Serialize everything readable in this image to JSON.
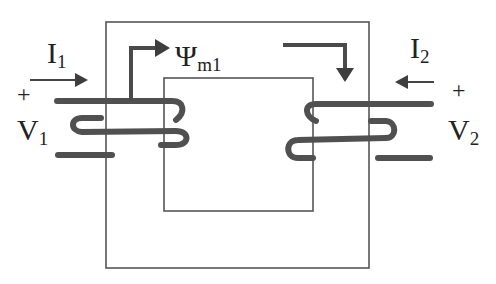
{
  "diagram": {
    "type": "single-phase transformer magnetic circuit",
    "colors": {
      "background": "#ffffff",
      "core": "#555555",
      "winding": "#505050",
      "text": "#222222"
    },
    "labels": {
      "primary_current": {
        "base": "I",
        "sub": "1"
      },
      "secondary_current": {
        "base": "I",
        "sub": "2"
      },
      "primary_voltage": {
        "base": "V",
        "sub": "1"
      },
      "secondary_voltage": {
        "base": "V",
        "sub": "2"
      },
      "flux": {
        "base": "Ψ",
        "sub": "m1"
      },
      "primary_plus": "+",
      "secondary_plus": "+"
    }
  }
}
